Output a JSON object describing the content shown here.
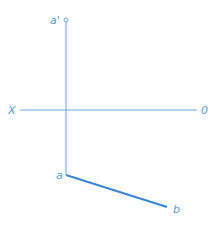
{
  "diagram": {
    "labels": {
      "a_prime": "a'",
      "a": "a",
      "b": "b",
      "x": "X",
      "o": "0"
    },
    "colors": {
      "line": "#5b9bd5",
      "segment": "#3a86d4"
    }
  }
}
